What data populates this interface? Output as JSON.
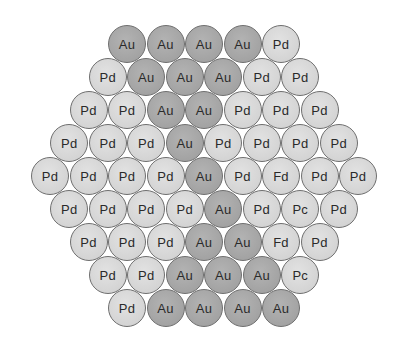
{
  "diagram": {
    "type": "hexagonal-close-packed-atom-arrangement",
    "colors": {
      "au": "#a6a6a6",
      "pd": "#d6d6d6",
      "outline": "#6e6e6e",
      "text": "#2a2a2a"
    },
    "layout": {
      "center_x": 204,
      "first_row_y": 44,
      "row_spacing": 33,
      "col_spacing": 38.5
    },
    "rows": [
      [
        "Au",
        "Au",
        "Au",
        "Au",
        "Pd"
      ],
      [
        "Pd",
        "Au",
        "Au",
        "Au",
        "Pd",
        "Pd"
      ],
      [
        "Pd",
        "Pd",
        "Au",
        "Au",
        "Pd",
        "Pd",
        "Pd"
      ],
      [
        "Pd",
        "Pd",
        "Pd",
        "Au",
        "Pd",
        "Pd",
        "Pd",
        "Pd"
      ],
      [
        "Pd",
        "Pd",
        "Pd",
        "Pd",
        "Au",
        "Pd",
        "Fd",
        "Pd",
        "Pd"
      ],
      [
        "Pd",
        "Pd",
        "Pd",
        "Pd",
        "Au",
        "Pd",
        "Pc",
        "Pd"
      ],
      [
        "Pd",
        "Pd",
        "Pd",
        "Au",
        "Au",
        "Fd",
        "Pd"
      ],
      [
        "Pd",
        "Pd",
        "Au",
        "Au",
        "Au",
        "Pc"
      ],
      [
        "Pd",
        "Au",
        "Au",
        "Au",
        "Au"
      ]
    ],
    "kinds": [
      [
        "au",
        "au",
        "au",
        "au",
        "pd"
      ],
      [
        "pd",
        "au",
        "au",
        "au",
        "pd",
        "pd"
      ],
      [
        "pd",
        "pd",
        "au",
        "au",
        "pd",
        "pd",
        "pd"
      ],
      [
        "pd",
        "pd",
        "pd",
        "au",
        "pd",
        "pd",
        "pd",
        "pd"
      ],
      [
        "pd",
        "pd",
        "pd",
        "pd",
        "au",
        "pd",
        "pd",
        "pd",
        "pd"
      ],
      [
        "pd",
        "pd",
        "pd",
        "pd",
        "au",
        "pd",
        "pd",
        "pd"
      ],
      [
        "pd",
        "pd",
        "pd",
        "au",
        "au",
        "pd",
        "pd"
      ],
      [
        "pd",
        "pd",
        "au",
        "au",
        "au",
        "pd"
      ],
      [
        "pd",
        "au",
        "au",
        "au",
        "au"
      ]
    ]
  }
}
